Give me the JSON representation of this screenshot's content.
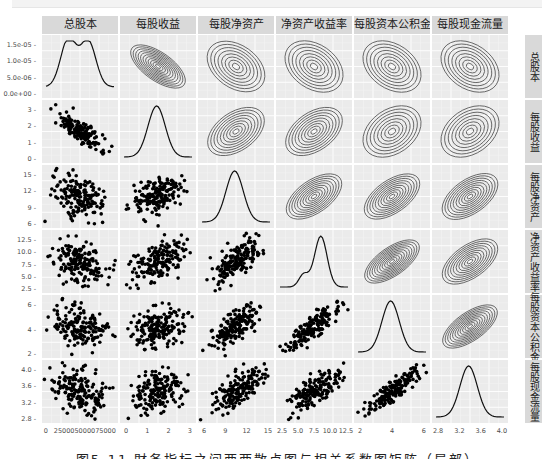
{
  "figure": {
    "caption": "图5-11  財务指标之间两两散点图与相关系数图矩阵（局部）",
    "variables": [
      "总股本",
      "每股收益",
      "每股净资产",
      "净资产收益率",
      "每股资本公积金",
      "每股现金流量"
    ]
  },
  "chart_data": {
    "type": "scatter",
    "subtype": "pairs-matrix (ggpairs): lower=scatter, diag=density, upper=2d-density contour",
    "title": "",
    "variables": [
      "总股本",
      "每股收益",
      "每股净资产",
      "净资产收益率",
      "每股资本公积金",
      "每股现金流量"
    ],
    "grid": true,
    "panel_background": "#ebebeb",
    "strip_background": "#d9d9d9",
    "axes": {
      "总股本": {
        "x_ticks": [
          "0",
          "25000",
          "50000",
          "75000"
        ],
        "x_tick_label_render": "0   250005000075000",
        "y_ticks_density": [
          "0.0e+00",
          "5.0e-06",
          "1.0e-05",
          "1.5e-05"
        ]
      },
      "每股收益": {
        "ticks": [
          "0",
          "1",
          "2",
          "3"
        ],
        "range": [
          -0.3,
          3.3
        ]
      },
      "每股净资产": {
        "ticks": [
          "6",
          "9",
          "12",
          "15"
        ],
        "range": [
          4.5,
          17
        ]
      },
      "净资产收益率": {
        "ticks": [
          "2.5",
          "5.0",
          "7.5",
          "10.0",
          "12.5"
        ],
        "range": [
          2,
          13
        ]
      },
      "每股资本公积金": {
        "ticks": [
          "2",
          "4",
          "6"
        ],
        "y_ticks": [
          "2",
          "4",
          "6"
        ],
        "range": [
          0.8,
          6.5
        ]
      },
      "每股现金流量": {
        "ticks": [
          "2.8",
          "3.2",
          "3.6",
          "4.0"
        ],
        "range": [
          2.7,
          4.15
        ]
      }
    },
    "y_axis_labels_left_column": [
      [
        "1.5e-05",
        "1.0e-05",
        "5.0e-06",
        "0.0e+00"
      ],
      [
        "3",
        "2",
        "1",
        "0"
      ],
      [
        "15",
        "12",
        "9",
        "6"
      ],
      [
        "12.5",
        "10.0",
        "7.5",
        "5.0",
        "2.5"
      ],
      [
        "6",
        "4",
        "2"
      ],
      [
        "4.0",
        "3.6",
        "3.2",
        "2.8"
      ]
    ],
    "x_axis_labels_bottom_row": [
      [
        "0",
        "250005000075000"
      ],
      [
        "0",
        "1",
        "2",
        "3"
      ],
      [
        "6",
        "9",
        "12",
        "15"
      ],
      [
        "2.5",
        "5.0",
        "7.5",
        "10.0",
        "12.5"
      ],
      [
        "2",
        "4",
        "6"
      ],
      [
        "2.8",
        "3.2",
        "3.6",
        "4.0"
      ]
    ],
    "correlation_direction": {
      "总股本-每股收益": "negative (strong)",
      "总股本-每股净资产": "negative (weak)",
      "总股本-净资产收益率": "negative (weak)",
      "总股本-每股资本公积金": "negative (weak)",
      "总股本-每股现金流量": "negative (weak)",
      "每股收益-每股净资产": "positive (moderate)",
      "每股收益-净资产收益率": "positive (moderate)",
      "每股收益-每股资本公积金": "positive (weak)",
      "每股收益-每股现金流量": "positive (weak)",
      "每股净资产-净资产收益率": "positive (moderate)",
      "每股净资产-每股资本公积金": "positive (moderate)",
      "每股净资产-每股现金流量": "positive (moderate)",
      "净资产收益率-每股资本公积金": "positive (strong)",
      "净资产收益率-每股现金流量": "positive (moderate)",
      "每股资本公积金-每股现金流量": "positive (strong)"
    },
    "diagonal_density_shapes": {
      "总股本": "bimodal, peaks near 1.5e-05",
      "每股收益": "unimodal, peak ~1.5",
      "每股净资产": "unimodal, peak ~11",
      "净资产收益率": "unimodal left-skewed, peak ~9",
      "每股资本公积金": "unimodal, peak ~4",
      "每股现金流量": "unimodal, peak ~3.5"
    }
  }
}
